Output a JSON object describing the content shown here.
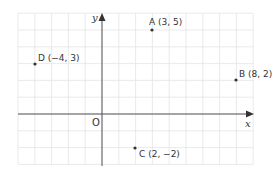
{
  "diagram": {
    "type": "coordinate-plane",
    "x_axis_label": "x",
    "y_axis_label": "y",
    "origin_label": "O",
    "grid": {
      "x_min": -5,
      "x_max": 9,
      "y_min": -3,
      "y_max": 6
    },
    "colors": {
      "grid": "#e4e4e4",
      "axis": "#555555",
      "point": "#333333",
      "text": "#333333"
    },
    "points": [
      {
        "name": "A",
        "x": 3,
        "y": 5,
        "label": "A (3, 5)"
      },
      {
        "name": "B",
        "x": 8,
        "y": 2,
        "label": "B (8, 2)"
      },
      {
        "name": "C",
        "x": 2,
        "y": -2,
        "label": "C (2, −2)"
      },
      {
        "name": "D",
        "x": -4,
        "y": 3,
        "label": "D (−4, 3)"
      }
    ]
  }
}
